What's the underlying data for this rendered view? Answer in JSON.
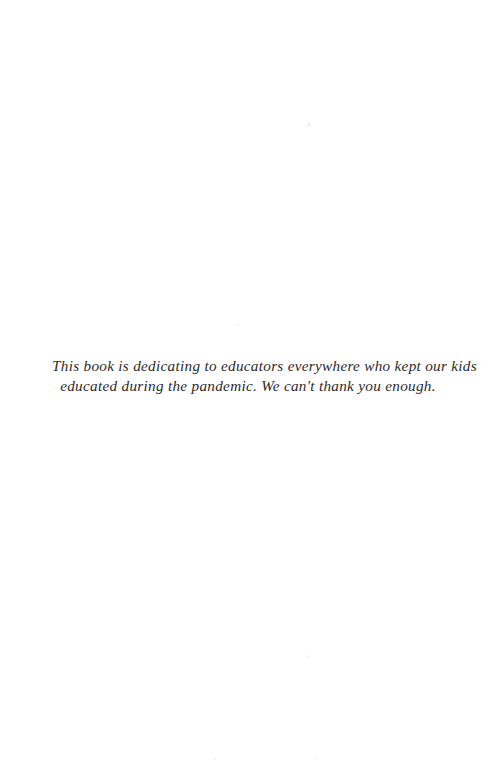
{
  "page": {
    "type": "book-dedication-page",
    "background_color": "#ffffff",
    "text_color": "#2b2a2c",
    "page_number": "",
    "header": "",
    "footer": ""
  },
  "dedication": {
    "full_text": "This book is dedicating to educators everywhere who kept our kids educated during the pandemic. We can't thank you enough.",
    "lines": [
      "This book is dedicating to educators everywhere who kept our kids",
      "educated during the pandemic. We can't thank you enough."
    ]
  }
}
